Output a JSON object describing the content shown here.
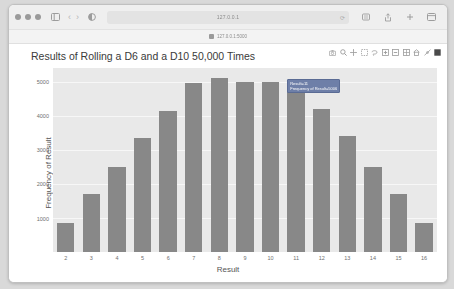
{
  "browser": {
    "window_controls": [
      "close",
      "minimize",
      "maximize"
    ],
    "sidebar_icon": "sidebar-icon",
    "back_label": "‹",
    "forward_label": "›",
    "shield_icon": "privacy-shield-icon",
    "address_value": "127.0.0.1",
    "address_placeholder": "Search or enter website name",
    "reload_label": "⟳",
    "right_icons": [
      "reader-icon",
      "share-icon",
      "new-tab-icon",
      "tab-overview-icon"
    ],
    "bookmark": {
      "favicon": "bookmark-favicon",
      "label": "127.0.0.1:5000"
    }
  },
  "modebar": {
    "buttons": [
      {
        "name": "camera-icon",
        "glyph": "camera"
      },
      {
        "name": "zoom-icon",
        "glyph": "zoom"
      },
      {
        "name": "pan-icon",
        "glyph": "pan"
      },
      {
        "name": "zoom-in-box-icon",
        "glyph": "zoombox"
      },
      {
        "name": "lasso-select-icon",
        "glyph": "lasso"
      },
      {
        "name": "zoom-in-icon",
        "glyph": "plus"
      },
      {
        "name": "zoom-out-icon",
        "glyph": "minus"
      },
      {
        "name": "autoscale-icon",
        "glyph": "autoscale"
      },
      {
        "name": "reset-axes-icon",
        "glyph": "home"
      },
      {
        "name": "toggle-spike-lines-icon",
        "glyph": "spike"
      },
      {
        "name": "hover-compare-icon",
        "glyph": "compare"
      }
    ]
  },
  "tooltip": {
    "line1": "Result=11",
    "line2": "Frequency of Result=5006"
  },
  "chart_data": {
    "type": "bar",
    "title": "Results of Rolling a D6 and a D10 50,000 Times",
    "xlabel": "Result",
    "ylabel": "Frequency of Result",
    "categories": [
      2,
      3,
      4,
      5,
      6,
      7,
      8,
      9,
      10,
      11,
      12,
      13,
      14,
      15,
      16
    ],
    "values": [
      850,
      1700,
      2500,
      3350,
      4150,
      4950,
      5100,
      5000,
      5000,
      5000,
      4200,
      3400,
      2500,
      1700,
      850
    ],
    "ylim": [
      0,
      5400
    ],
    "yticks": [
      1000,
      2000,
      3000,
      4000,
      5000
    ],
    "xticks": [
      2,
      3,
      4,
      5,
      6,
      7,
      8,
      9,
      10,
      11,
      12,
      13,
      14,
      15,
      16
    ],
    "grid": true,
    "legend": "none",
    "bar_color": "#888888",
    "plot_bgcolor": "#e9e9e9",
    "paper_bgcolor": "#ffffff"
  }
}
